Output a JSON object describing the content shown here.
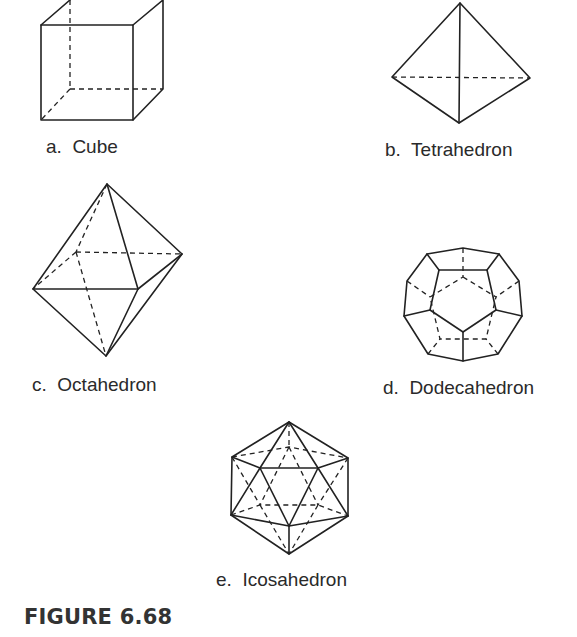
{
  "figure": {
    "caption": "FIGURE 6.68",
    "panels": [
      {
        "id": "a",
        "label": "a.  Cube",
        "shape": "cube"
      },
      {
        "id": "b",
        "label": "b.  Tetrahedron",
        "shape": "tetrahedron"
      },
      {
        "id": "c",
        "label": "c.  Octahedron",
        "shape": "octahedron"
      },
      {
        "id": "d",
        "label": "d.  Dodecahedron",
        "shape": "dodecahedron"
      },
      {
        "id": "e",
        "label": "e.  Icosahedron",
        "shape": "icosahedron"
      }
    ],
    "line_style": {
      "solid": "visible edges",
      "dashed": "hidden edges"
    },
    "stroke_color": "#222222"
  }
}
